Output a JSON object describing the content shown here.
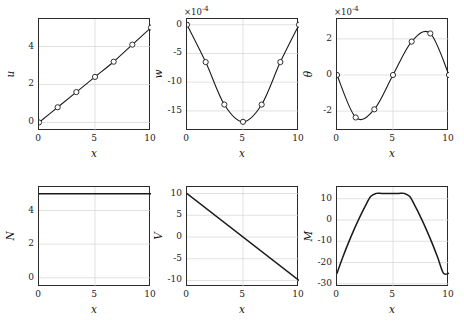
{
  "figure": {
    "layout": "2x3 subplot grid",
    "background": "#ffffff",
    "line_color": "#1a1a1a",
    "grid_color": "#d4d4d4",
    "axis_color": "#2a2a2a",
    "marker_face": "#ffffff"
  },
  "chart_data": [
    {
      "id": "u",
      "type": "line",
      "title": "",
      "xlabel": "x",
      "ylabel": "u",
      "xlim": [
        0,
        10
      ],
      "ylim": [
        -0.45,
        5.45
      ],
      "xticks": [
        0,
        5,
        10
      ],
      "xtick_labels": [
        "0",
        "5",
        "10"
      ],
      "yticks": [
        0,
        2,
        4
      ],
      "ytick_labels": [
        "0",
        "2",
        "4"
      ],
      "grid": true,
      "multiplier": "",
      "markers": true,
      "x": [
        0,
        1.6667,
        3.3333,
        5,
        6.6667,
        8.3333,
        10
      ],
      "values": [
        0,
        0.8,
        1.6,
        2.4,
        3.2,
        4.1,
        5.0
      ]
    },
    {
      "id": "w",
      "type": "line",
      "title": "",
      "xlabel": "x",
      "ylabel": "w",
      "xlim": [
        0,
        10
      ],
      "ylim": [
        -18.5,
        1.0
      ],
      "xticks": [
        0,
        5,
        10
      ],
      "xtick_labels": [
        "0",
        "5",
        "10"
      ],
      "yticks": [
        0,
        -5,
        -10,
        -15
      ],
      "ytick_labels": [
        "0",
        "-5",
        "-10",
        "-15"
      ],
      "grid": true,
      "multiplier": "×10",
      "multiplier_exp": "-4",
      "markers": true,
      "x": [
        0,
        1.6667,
        3.3333,
        5,
        6.6667,
        8.3333,
        10
      ],
      "values": [
        0,
        -6.5,
        -13.9,
        -16.9,
        -13.9,
        -6.5,
        0
      ]
    },
    {
      "id": "theta",
      "type": "line",
      "title": "",
      "xlabel": "x",
      "ylabel": "θ",
      "xlim": [
        0,
        10
      ],
      "ylim": [
        -3.1,
        3.1
      ],
      "xticks": [
        0,
        5,
        10
      ],
      "xtick_labels": [
        "0",
        "5",
        "10"
      ],
      "yticks": [
        2,
        0,
        -2
      ],
      "ytick_labels": [
        "2",
        "0",
        "-2"
      ],
      "grid": true,
      "multiplier": "×10",
      "multiplier_exp": "-4",
      "markers": true,
      "x": [
        0,
        1.6667,
        3.3333,
        5,
        6.6667,
        8.3333,
        10
      ],
      "values": [
        0,
        -2.35,
        -1.9,
        0,
        1.85,
        2.3,
        0
      ]
    },
    {
      "id": "N",
      "type": "line",
      "title": "",
      "xlabel": "x",
      "ylabel": "N",
      "xlim": [
        0,
        10
      ],
      "ylim": [
        -0.55,
        5.4
      ],
      "xticks": [
        0,
        5,
        10
      ],
      "xtick_labels": [
        "0",
        "5",
        "10"
      ],
      "yticks": [
        0,
        2,
        4
      ],
      "ytick_labels": [
        "0",
        "2",
        "4"
      ],
      "grid": true,
      "multiplier": "",
      "markers": false,
      "x": [
        0,
        10
      ],
      "values": [
        5,
        5
      ]
    },
    {
      "id": "V",
      "type": "line",
      "title": "",
      "xlabel": "x",
      "ylabel": "V",
      "xlim": [
        0,
        10
      ],
      "ylim": [
        -11.5,
        11.5
      ],
      "xticks": [
        0,
        5,
        10
      ],
      "xtick_labels": [
        "0",
        "5",
        "10"
      ],
      "yticks": [
        10,
        5,
        0,
        -5,
        -10
      ],
      "ytick_labels": [
        "10",
        "5",
        "0",
        "-5",
        "-10"
      ],
      "grid": true,
      "multiplier": "",
      "markers": false,
      "x": [
        0,
        10
      ],
      "values": [
        10,
        -10
      ]
    },
    {
      "id": "M",
      "type": "line",
      "title": "",
      "xlabel": "x",
      "ylabel": "M",
      "xlim": [
        0,
        10
      ],
      "ylim": [
        -31.5,
        15.5
      ],
      "xticks": [
        0,
        5,
        10
      ],
      "xtick_labels": [
        "0",
        "5",
        "10"
      ],
      "yticks": [
        10,
        0,
        -10,
        -20,
        -30
      ],
      "ytick_labels": [
        "10",
        "0",
        "-10",
        "-20",
        "-30"
      ],
      "grid": true,
      "multiplier": "",
      "markers": false,
      "x": [
        0,
        0.5,
        1,
        1.5,
        2,
        2.5,
        3,
        3.5,
        4,
        4.5,
        5,
        5.5,
        6,
        6.5,
        7,
        7.5,
        8,
        8.5,
        9,
        9.5,
        10
      ],
      "values": [
        -25,
        -17.75,
        -11,
        -4.75,
        1,
        6.25,
        11,
        12.5,
        12.5,
        12.5,
        12.5,
        12.5,
        12.5,
        11,
        6.25,
        1,
        -4.75,
        -11,
        -17.75,
        -25,
        -25
      ]
    }
  ]
}
